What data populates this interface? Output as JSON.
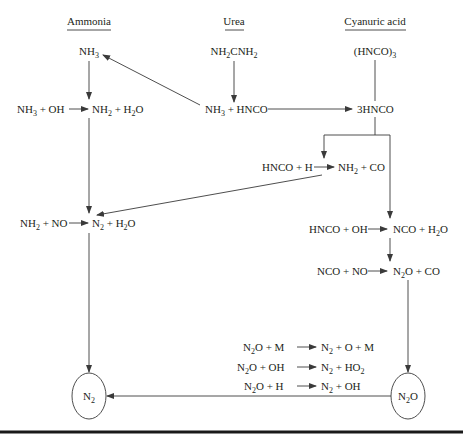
{
  "headers": {
    "ammonia": "Ammonia",
    "urea": "Urea",
    "cyanuric_acid": "Cyanuric acid"
  },
  "species": {
    "nh3": {
      "base": "NH",
      "sub": "3"
    },
    "urea": {
      "p1": "NH",
      "s1": "2",
      "p2": "CNH",
      "s2": "2"
    },
    "cyanuric": {
      "p1": "(HNCO)",
      "s1": "3"
    },
    "nh3_hnco": {
      "p1": "NH",
      "s1": "3",
      "p2": " + HNCO"
    },
    "three_hnco": "3HNCO",
    "n2_terminal": {
      "base": "N",
      "sub": "2"
    },
    "n2o_terminal": {
      "p1": "N",
      "s1": "2",
      "p2": "O"
    }
  },
  "reactions": [
    {
      "id": "nh3-oh",
      "lhs": [
        [
          "NH",
          "3"
        ],
        [
          " + OH",
          ""
        ]
      ],
      "rhs": [
        [
          "NH",
          "2"
        ],
        [
          " + H",
          "2"
        ],
        [
          "O",
          ""
        ]
      ]
    },
    {
      "id": "hnco-h",
      "lhs": [
        [
          "HNCO + H",
          ""
        ]
      ],
      "rhs": [
        [
          "NH",
          "2"
        ],
        [
          " + CO",
          ""
        ]
      ]
    },
    {
      "id": "nh2-no",
      "lhs": [
        [
          "NH",
          "2"
        ],
        [
          " + NO",
          ""
        ]
      ],
      "rhs": [
        [
          "N",
          "2"
        ],
        [
          " + H",
          "2"
        ],
        [
          "O",
          ""
        ]
      ]
    },
    {
      "id": "hnco-oh",
      "lhs": [
        [
          "HNCO + OH",
          ""
        ]
      ],
      "rhs": [
        [
          "NCO + H",
          "2"
        ],
        [
          "O",
          ""
        ]
      ]
    },
    {
      "id": "nco-no",
      "lhs": [
        [
          "NCO + NO",
          ""
        ]
      ],
      "rhs": [
        [
          "N",
          "2"
        ],
        [
          "O + CO",
          ""
        ]
      ]
    },
    {
      "id": "n2o-m",
      "lhs": [
        [
          "N",
          "2"
        ],
        [
          "O + M",
          ""
        ]
      ],
      "rhs": [
        [
          "N",
          "2"
        ],
        [
          " + O + M",
          ""
        ]
      ]
    },
    {
      "id": "n2o-oh",
      "lhs": [
        [
          "N",
          "2"
        ],
        [
          "O + OH",
          ""
        ]
      ],
      "rhs": [
        [
          "N",
          "2"
        ],
        [
          " + HO",
          "2"
        ]
      ]
    },
    {
      "id": "n2o-h",
      "lhs": [
        [
          "N",
          "2"
        ],
        [
          "O + H",
          ""
        ]
      ],
      "rhs": [
        [
          "N",
          "2"
        ],
        [
          " + OH",
          ""
        ]
      ]
    }
  ],
  "colors": {
    "line": "#3a3a3a",
    "text": "#231f20",
    "rule": "#1a1a1a"
  }
}
